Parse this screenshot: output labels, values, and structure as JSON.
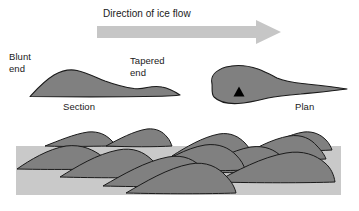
{
  "figure": {
    "title": "Direction of ice flow",
    "background_color": "#ffffff",
    "labels": {
      "blunt_end": "Blunt\nend",
      "tapered_end": "Tapered\nend",
      "section": "Section",
      "plan": "Plan"
    },
    "colors": {
      "arrow_fill": "#c6c6c6",
      "landform_fill": "#808080",
      "landform_stroke": "#1a1a1a",
      "field_band_fill": "#c9c9c9",
      "flow_marker_fill": "#000000",
      "text": "#1a1a1a"
    },
    "arrow": {
      "name": "ice-flow-arrow",
      "direction": "right",
      "x_start": 97,
      "x_end": 281,
      "y_center": 32,
      "shaft_height": 11,
      "head_height": 23
    },
    "section_view": {
      "name": "drumlin-section-profile",
      "orientation": "profile",
      "blunt_end_side": "left",
      "tapered_end_side": "right",
      "x_start": 30,
      "x_end": 181,
      "y_top": 70,
      "y_base": 97
    },
    "plan_view": {
      "name": "drumlin-plan-outline",
      "orientation": "map",
      "blunt_end_side": "left",
      "tapered_end_side": "right",
      "x_start": 209,
      "x_end": 347,
      "y_top": 65,
      "y_bottom": 104,
      "flow_marker": {
        "name": "flow-direction-triangle",
        "cx": 239,
        "cy": 92,
        "size": 9
      }
    },
    "field_band": {
      "name": "drumlin-field-band",
      "x": 16,
      "y": 146,
      "width": 325,
      "height": 49
    },
    "field_drumlins": [
      {
        "name": "drumlin-field-shape-1",
        "path": "M 17 169 C 30 160 48 149 66 146 C 82 144 94 150 103 157 C 109 162 112 166 113 169 C 95 169 60 170 17 169 Z"
      },
      {
        "name": "drumlin-field-shape-2",
        "path": "M 45 146 C 58 141 74 134 88 132 C 99 131 106 135 111 140 C 114 143 115 145 116 146 C 100 146 70 147 45 146 Z"
      },
      {
        "name": "drumlin-field-shape-3",
        "path": "M 106 146 C 119 139 134 131 147 129 C 157 128 163 132 167 137 C 170 140 171 144 172 146 C 155 147 130 147 106 146 Z"
      },
      {
        "name": "drumlin-field-shape-4",
        "path": "M 60 177 C 76 167 97 154 118 150 C 133 147 144 152 152 160 C 158 165 161 171 162 177 C 138 178 96 178 60 177 Z"
      },
      {
        "name": "drumlin-field-shape-5",
        "path": "M 103 186 C 122 175 146 161 168 157 C 184 154 195 160 203 169 C 209 175 212 181 213 186 C 186 187 143 187 103 186 Z"
      },
      {
        "name": "drumlin-field-shape-6",
        "path": "M 150 170 C 166 160 186 148 205 145 C 219 143 229 148 236 155 C 241 160 244 165 245 170 C 222 171 186 171 150 170 Z"
      },
      {
        "name": "drumlin-field-shape-7",
        "path": "M 126 193 C 145 182 168 168 190 164 C 206 161 218 167 226 176 C 232 182 235 188 236 193 C 208 194 165 194 126 193 Z"
      },
      {
        "name": "drumlin-field-shape-8",
        "path": "M 196 172 C 212 162 232 150 251 147 C 265 145 275 150 282 157 C 287 162 290 167 291 172 C 268 173 232 173 196 172 Z"
      },
      {
        "name": "drumlin-field-shape-9",
        "path": "M 238 159 C 253 149 272 139 289 136 C 302 134 311 139 317 146 C 322 151 325 156 326 159 C 305 160 271 160 238 159 Z"
      },
      {
        "name": "drumlin-field-shape-10",
        "path": "M 216 182 C 236 171 262 157 286 153 C 303 150 316 155 325 163 C 331 168 334 175 335 182 C 306 183 258 183 216 182 Z"
      },
      {
        "name": "drumlin-field-shape-11",
        "path": "M 262 150 C 275 142 290 134 304 132 C 314 131 321 135 326 140 C 329 143 331 147 332 150 C 315 151 288 151 262 150 Z"
      },
      {
        "name": "drumlin-field-shape-12",
        "path": "M 172 156 C 186 147 203 137 219 134 C 231 132 239 137 245 143 C 249 147 251 152 252 156 C 233 157 203 157 172 156 Z"
      }
    ]
  }
}
